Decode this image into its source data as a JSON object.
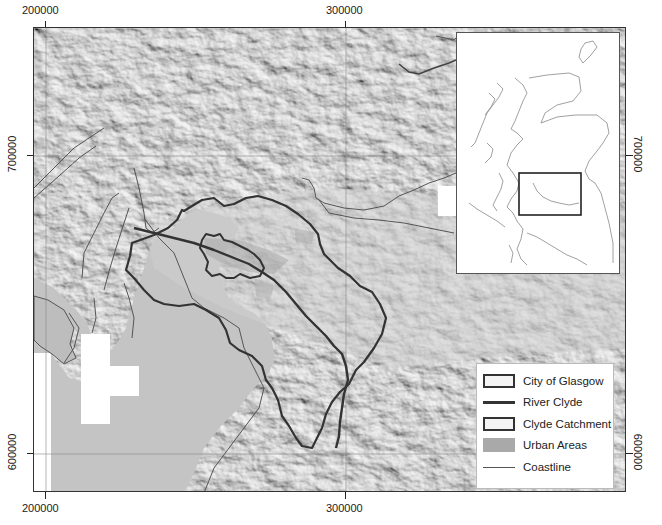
{
  "axes": {
    "x_ticks": [
      {
        "label": "200000",
        "x": 45
      },
      {
        "label": "300000",
        "x": 345
      }
    ],
    "y_ticks": [
      {
        "label": "700000",
        "y": 155
      },
      {
        "label": "600000",
        "y": 453
      }
    ]
  },
  "legend": {
    "items": [
      {
        "label": "City of Glasgow",
        "symbol": "outline-box"
      },
      {
        "label": "River Clyde",
        "symbol": "thick-line"
      },
      {
        "label": "Clyde Catchment",
        "symbol": "outline-box"
      },
      {
        "label": "Urban Areas",
        "symbol": "grey-fill"
      },
      {
        "label": "Coastline",
        "symbol": "thin-line"
      }
    ]
  },
  "inset": {
    "description": "Scotland overview map with study area box"
  },
  "colors": {
    "hillshade": "#c9c9c9",
    "boundary": "#333333",
    "urban": "#a9a9a9",
    "coastline": "#555555",
    "nodata": "#ffffff"
  }
}
